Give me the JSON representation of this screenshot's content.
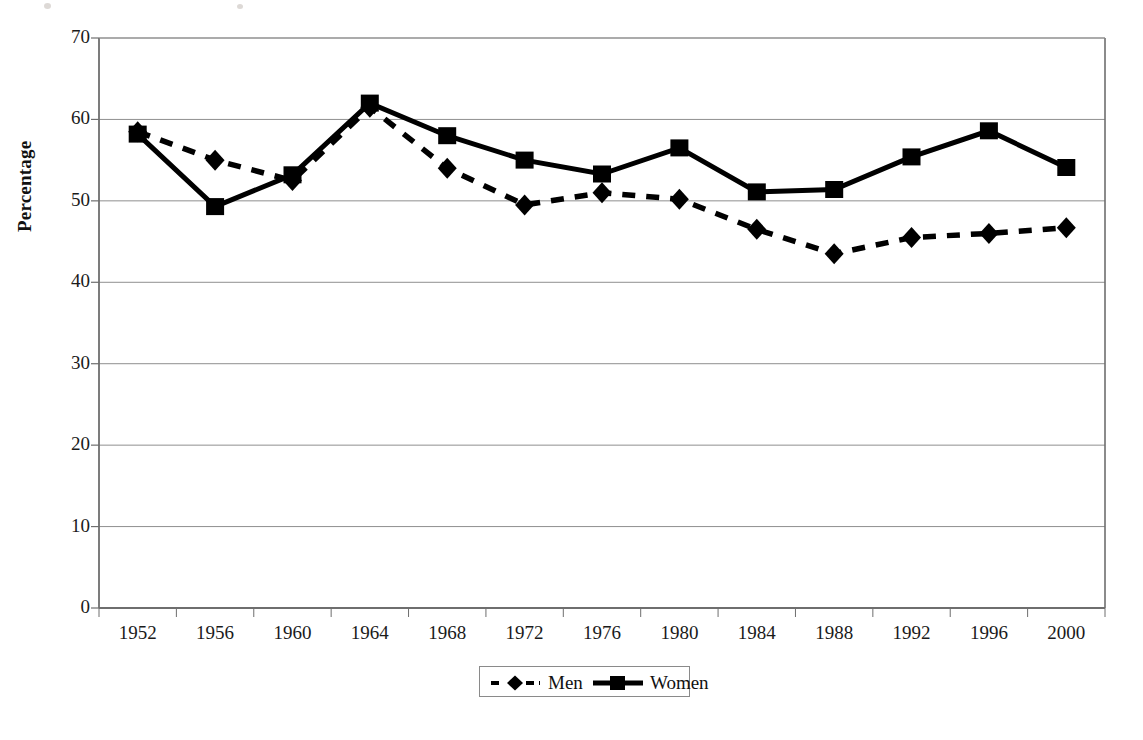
{
  "axis": {
    "y_label": "Percentage",
    "y_ticks": [
      "0",
      "10",
      "20",
      "30",
      "40",
      "50",
      "60",
      "70"
    ],
    "x_ticks": [
      "1952",
      "1956",
      "1960",
      "1964",
      "1968",
      "1972",
      "1976",
      "1980",
      "1984",
      "1988",
      "1992",
      "1996",
      "2000"
    ]
  },
  "legend": {
    "men_label": "Men",
    "women_label": "Women",
    "men_marker": "diamond-marker-icon",
    "women_marker": "square-marker-icon",
    "men_linestyle": "dashed",
    "women_linestyle": "solid"
  },
  "colors": {
    "series": "#000000",
    "gridline": "#8f8f8f",
    "axis": "#6e6e6e",
    "background": "#ffffff"
  },
  "chart_data": {
    "type": "line",
    "title": "",
    "subtitle": "",
    "xlabel": "",
    "ylabel": "Percentage",
    "x": [
      1952,
      1956,
      1960,
      1964,
      1968,
      1972,
      1976,
      1980,
      1984,
      1988,
      1992,
      1996,
      2000
    ],
    "categories": [
      "1952",
      "1956",
      "1960",
      "1964",
      "1968",
      "1972",
      "1976",
      "1980",
      "1984",
      "1988",
      "1992",
      "1996",
      "2000"
    ],
    "ylim": [
      0,
      70
    ],
    "ytick_step": 10,
    "grid": true,
    "legend_position": "bottom-center",
    "series": [
      {
        "name": "Men",
        "linestyle": "dashed",
        "marker": "diamond",
        "values": [
          58.5,
          55.0,
          52.5,
          61.5,
          54.0,
          49.5,
          51.0,
          50.2,
          46.5,
          43.5,
          45.5,
          46.0,
          46.7
        ]
      },
      {
        "name": "Women",
        "linestyle": "solid",
        "marker": "square",
        "values": [
          58.2,
          49.3,
          53.2,
          62.0,
          58.0,
          55.0,
          53.3,
          56.5,
          51.1,
          51.4,
          55.4,
          58.6,
          54.1
        ]
      }
    ]
  }
}
